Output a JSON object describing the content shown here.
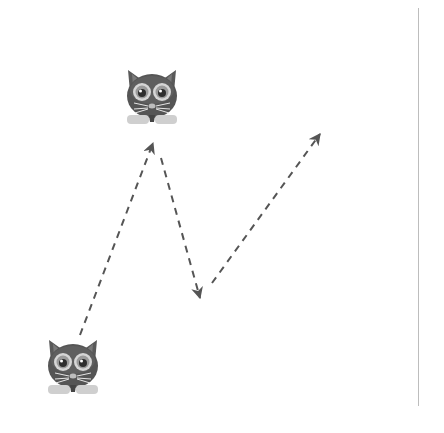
{
  "diagram": {
    "colors": {
      "background": "#ffffff",
      "arrow": "#555555",
      "cat_body": "#5a5a5a",
      "cat_dark": "#3a3a3a",
      "cat_eye_ring": "#d6d6d6",
      "cat_paws": "#cfcfcf",
      "rule": "#bdbdbd"
    },
    "sprites": [
      {
        "name": "cat-top",
        "x": 122,
        "y": 66,
        "size": 60
      },
      {
        "name": "cat-bottom",
        "x": 43,
        "y": 336,
        "size": 60
      }
    ],
    "arrows": [
      {
        "name": "arrow-1",
        "from": [
          80,
          335
        ],
        "to": [
          153,
          143
        ]
      },
      {
        "name": "arrow-2",
        "from": [
          161,
          158
        ],
        "to": [
          200,
          298
        ]
      },
      {
        "name": "arrow-3",
        "from": [
          212,
          283
        ],
        "to": [
          320,
          134
        ]
      }
    ]
  }
}
